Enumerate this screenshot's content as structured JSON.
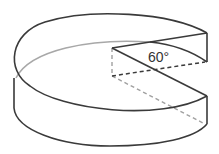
{
  "diagram": {
    "type": "3d-pie-cylinder-with-sector-removed",
    "angle_label": "60°",
    "colors": {
      "outline": "#3a3a3a",
      "hidden_edge": "#a8a8a8",
      "dashed_hidden": "#9a9a9a",
      "dashed_visible": "#3a3a3a",
      "background": "#ffffff"
    }
  }
}
